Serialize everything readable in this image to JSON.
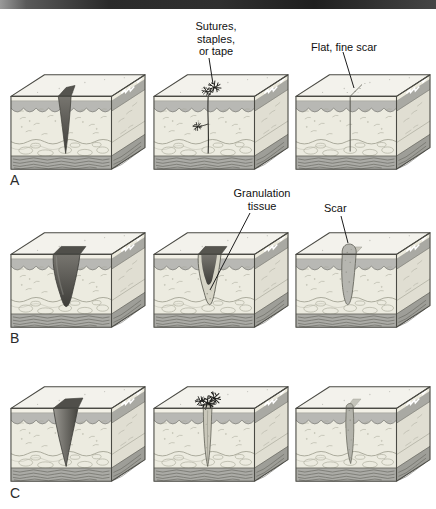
{
  "figure": {
    "annotations": {
      "sutures": "Sutures,\nstaples,\nor tape",
      "flat_fine_scar": "Flat, fine scar",
      "granulation": "Granulation\ntissue",
      "scar": "Scar"
    },
    "rows": [
      {
        "letter": "A",
        "panels": [
          {
            "wound": "open-incision"
          },
          {
            "wound": "sutured-incision"
          },
          {
            "wound": "healed-fine-scar"
          }
        ]
      },
      {
        "letter": "B",
        "panels": [
          {
            "wound": "open-gaping-wound"
          },
          {
            "wound": "granulation-tissue"
          },
          {
            "wound": "scar-blob"
          }
        ]
      },
      {
        "letter": "C",
        "panels": [
          {
            "wound": "open-wide-wound"
          },
          {
            "wound": "sutured-granulation"
          },
          {
            "wound": "wide-scar"
          }
        ]
      }
    ],
    "colors": {
      "top_bar_left": "#9a9a9a",
      "top_bar_dark": "#1f1f1f",
      "epidermis": "#b8b8b4",
      "dermis": "#ecebe0",
      "muscle": "#ababa6",
      "wound_dark": "#4a4945",
      "granulation": "#d6d4c6",
      "scar": "#b6b6b0"
    }
  }
}
